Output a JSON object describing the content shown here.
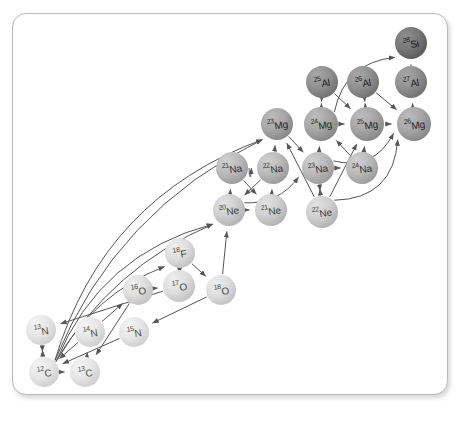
{
  "figure": {
    "type": "nuclear-reaction-network",
    "panel_background": "#ffffff",
    "panel_border_color": "#b9b9bc",
    "edge_color": "#55555a"
  },
  "nodes": [
    {
      "id": "12C",
      "mass": "12",
      "element": "C",
      "x": 44,
      "y": 372,
      "r": 15,
      "tier": "t0"
    },
    {
      "id": "13C",
      "mass": "13",
      "element": "C",
      "x": 85,
      "y": 372,
      "r": 15,
      "tier": "t0"
    },
    {
      "id": "13N",
      "mass": "13",
      "element": "N",
      "x": 41,
      "y": 330,
      "r": 15,
      "tier": "t0"
    },
    {
      "id": "14N",
      "mass": "14",
      "element": "N",
      "x": 90,
      "y": 332,
      "r": 15,
      "tier": "t0"
    },
    {
      "id": "15N",
      "mass": "15",
      "element": "N",
      "x": 134,
      "y": 332,
      "r": 15,
      "tier": "t0"
    },
    {
      "id": "16O",
      "mass": "16",
      "element": "O",
      "x": 138,
      "y": 290,
      "r": 15,
      "tier": "t1"
    },
    {
      "id": "17O",
      "mass": "17",
      "element": "O",
      "x": 179,
      "y": 286,
      "r": 16,
      "tier": "t1"
    },
    {
      "id": "18O",
      "mass": "18",
      "element": "O",
      "x": 221,
      "y": 290,
      "r": 15,
      "tier": "t1"
    },
    {
      "id": "18F",
      "mass": "18",
      "element": "F",
      "x": 180,
      "y": 253,
      "r": 15,
      "tier": "t1"
    },
    {
      "id": "20Ne",
      "mass": "20",
      "element": "Ne",
      "x": 229,
      "y": 210,
      "r": 16,
      "tier": "t2"
    },
    {
      "id": "21Ne",
      "mass": "21",
      "element": "Ne",
      "x": 271,
      "y": 210,
      "r": 16,
      "tier": "t2"
    },
    {
      "id": "22Ne",
      "mass": "22",
      "element": "Ne",
      "x": 322,
      "y": 212,
      "r": 16,
      "tier": "t2"
    },
    {
      "id": "21Na",
      "mass": "21",
      "element": "Na",
      "x": 232,
      "y": 168,
      "r": 16,
      "tier": "t3"
    },
    {
      "id": "22Na",
      "mass": "22",
      "element": "Na",
      "x": 273,
      "y": 168,
      "r": 16,
      "tier": "t3"
    },
    {
      "id": "23Na",
      "mass": "23",
      "element": "Na",
      "x": 318,
      "y": 168,
      "r": 16,
      "tier": "t3"
    },
    {
      "id": "24Na",
      "mass": "24",
      "element": "Na",
      "x": 362,
      "y": 168,
      "r": 16,
      "tier": "t3"
    },
    {
      "id": "23Mg",
      "mass": "23",
      "element": "Mg",
      "x": 277,
      "y": 124,
      "r": 16,
      "tier": "t4"
    },
    {
      "id": "24Mg",
      "mass": "24",
      "element": "Mg",
      "x": 321,
      "y": 124,
      "r": 17,
      "tier": "t4"
    },
    {
      "id": "25Mg",
      "mass": "25",
      "element": "Mg",
      "x": 367,
      "y": 124,
      "r": 17,
      "tier": "t4"
    },
    {
      "id": "26Mg",
      "mass": "26",
      "element": "Mg",
      "x": 414,
      "y": 124,
      "r": 17,
      "tier": "t4"
    },
    {
      "id": "25Al",
      "mass": "25",
      "element": "Al",
      "x": 322,
      "y": 82,
      "r": 16,
      "tier": "t5"
    },
    {
      "id": "26Al",
      "mass": "26",
      "element": "Al",
      "x": 363,
      "y": 82,
      "r": 16,
      "tier": "t5"
    },
    {
      "id": "27Al",
      "mass": "27",
      "element": "Al",
      "x": 411,
      "y": 82,
      "r": 16,
      "tier": "t5"
    },
    {
      "id": "28Si",
      "mass": "28",
      "element": "Si",
      "x": 411,
      "y": 43,
      "r": 16,
      "tier": "t6"
    }
  ],
  "edges": [
    {
      "from": "12C",
      "to": "13C",
      "curve": 0
    },
    {
      "from": "12C",
      "to": "13N",
      "curve": 0
    },
    {
      "from": "13N",
      "to": "12C",
      "curve": 0
    },
    {
      "from": "13C",
      "to": "14N",
      "curve": 0
    },
    {
      "from": "14N",
      "to": "12C",
      "curve": 0
    },
    {
      "from": "15N",
      "to": "12C",
      "curve": 0
    },
    {
      "from": "14N",
      "to": "16O",
      "curve": 0
    },
    {
      "from": "16O",
      "to": "17O",
      "curve": 0
    },
    {
      "from": "17O",
      "to": "18F",
      "curve": 0
    },
    {
      "from": "18F",
      "to": "18O",
      "curve": 0
    },
    {
      "from": "18O",
      "to": "15N",
      "curve": 0
    },
    {
      "from": "18O",
      "to": "20Ne",
      "curve": 0
    },
    {
      "from": "16O",
      "to": "13C",
      "curve": 0
    },
    {
      "from": "17O",
      "to": "13N",
      "curve": 0
    },
    {
      "from": "12C",
      "to": "18F",
      "curve": -26
    },
    {
      "from": "12C",
      "to": "20Ne",
      "curve": -34
    },
    {
      "from": "12C",
      "to": "20Ne",
      "curve": -52
    },
    {
      "from": "12C",
      "to": "23Mg",
      "curve": -58
    },
    {
      "from": "12C",
      "to": "23Mg",
      "curve": -76
    },
    {
      "from": "20Ne",
      "to": "21Ne",
      "curve": 0
    },
    {
      "from": "20Ne",
      "to": "21Na",
      "curve": 0
    },
    {
      "from": "21Ne",
      "to": "22Na",
      "curve": 0
    },
    {
      "from": "21Na",
      "to": "21Ne",
      "curve": 0
    },
    {
      "from": "22Na",
      "to": "20Ne",
      "curve": 0
    },
    {
      "from": "22Ne",
      "to": "23Na",
      "curve": 0
    },
    {
      "from": "23Na",
      "to": "22Ne",
      "curve": 0
    },
    {
      "from": "23Na",
      "to": "24Na",
      "curve": 0
    },
    {
      "from": "22Na",
      "to": "23Mg",
      "curve": 0
    },
    {
      "from": "23Mg",
      "to": "23Na",
      "curve": 0
    },
    {
      "from": "23Na",
      "to": "24Mg",
      "curve": 0
    },
    {
      "from": "24Na",
      "to": "24Mg",
      "curve": 0
    },
    {
      "from": "22Ne",
      "to": "23Mg",
      "curve": 0
    },
    {
      "from": "22Ne",
      "to": "25Mg",
      "curve": 0
    },
    {
      "from": "24Mg",
      "to": "25Mg",
      "curve": 0
    },
    {
      "from": "25Mg",
      "to": "26Mg",
      "curve": 0
    },
    {
      "from": "24Mg",
      "to": "25Al",
      "curve": 0
    },
    {
      "from": "25Mg",
      "to": "26Al",
      "curve": 0
    },
    {
      "from": "26Mg",
      "to": "27Al",
      "curve": 0
    },
    {
      "from": "25Al",
      "to": "24Mg",
      "curve": 0
    },
    {
      "from": "26Al",
      "to": "25Mg",
      "curve": 0
    },
    {
      "from": "25Al",
      "to": "25Mg",
      "curve": 0
    },
    {
      "from": "26Al",
      "to": "26Mg",
      "curve": 0
    },
    {
      "from": "27Al",
      "to": "28Si",
      "curve": 0
    },
    {
      "from": "24Mg",
      "to": "28Si",
      "curve": -30
    },
    {
      "from": "23Na",
      "to": "26Mg",
      "curve": 26
    },
    {
      "from": "22Ne",
      "to": "26Mg",
      "curve": 40
    },
    {
      "from": "24Na",
      "to": "25Mg",
      "curve": 0
    },
    {
      "from": "21Na",
      "to": "22Na",
      "curve": 18
    },
    {
      "from": "20Ne",
      "to": "23Na",
      "curve": 16
    }
  ]
}
